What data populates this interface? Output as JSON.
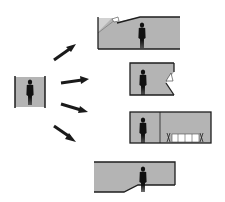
{
  "diagram": {
    "colors": {
      "background": "#ffffff",
      "room_fill": "#b4b4b4",
      "light_fill": "#d2d2d2",
      "wall": "#1e1e1e",
      "figure": "#111111",
      "arrow": "#1a1a1a",
      "furniture": "#ffffff"
    },
    "source": {
      "label": "narrow-room-with-person"
    },
    "arrows": [
      {
        "id": "arrow-1",
        "target": "option-1"
      },
      {
        "id": "arrow-2",
        "target": "option-2"
      },
      {
        "id": "arrow-3",
        "target": "option-3"
      },
      {
        "id": "arrow-4",
        "target": "option-4"
      }
    ],
    "options": [
      {
        "id": "option-1",
        "label": "room-with-sloped-ceiling-skylight"
      },
      {
        "id": "option-2",
        "label": "room-with-notched-wall-light"
      },
      {
        "id": "option-3",
        "label": "room-with-adjoining-dining-space"
      },
      {
        "id": "option-4",
        "label": "room-with-stepped-floor"
      }
    ]
  }
}
